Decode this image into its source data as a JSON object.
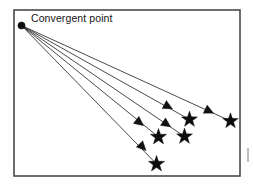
{
  "figure": {
    "label": "Convergent point",
    "label_position": {
      "x": 31,
      "y": 22
    },
    "background_color": "#ffffff",
    "frame": {
      "x": 14,
      "y": 10,
      "width": 226,
      "height": 166,
      "stroke_color": "#4a4a4a"
    },
    "convergent_point": {
      "x": 21.5,
      "y": 25.5,
      "radius": 3.6,
      "color": "#0d0d0d"
    },
    "marker_colors": {
      "ray": "#2a2a2a",
      "arrow": "#111111",
      "star": "#0d0d0d"
    },
    "ray_count": 5,
    "rays": [
      {
        "id": "ray-1",
        "name": "topmost-ray",
        "start": {
          "x": 21.5,
          "y": 25.5
        },
        "arrow": {
          "x": 209,
          "y": 111,
          "angle": 26
        },
        "star": {
          "x": 230.5,
          "y": 121,
          "size": 8.2
        },
        "end": {
          "x": 230.5,
          "y": 121
        }
      },
      {
        "id": "ray-2",
        "name": "second-ray",
        "start": {
          "x": 21.5,
          "y": 25.5
        },
        "arrow": {
          "x": 168,
          "y": 106.5,
          "angle": 28
        },
        "star": {
          "x": 189.5,
          "y": 119.5,
          "size": 8.4
        },
        "end": {
          "x": 189.5,
          "y": 119.5
        }
      },
      {
        "id": "ray-3",
        "name": "third-ray",
        "start": {
          "x": 21.5,
          "y": 25.5
        },
        "arrow": {
          "x": 166.5,
          "y": 124,
          "angle": 34
        },
        "star": {
          "x": 184.5,
          "y": 136.5,
          "size": 8.4
        },
        "end": {
          "x": 184.5,
          "y": 136.5
        }
      },
      {
        "id": "ray-4",
        "name": "fourth-ray",
        "start": {
          "x": 21.5,
          "y": 25.5
        },
        "arrow": {
          "x": 139.5,
          "y": 122.5,
          "angle": 38
        },
        "star": {
          "x": 158.5,
          "y": 137,
          "size": 8.6
        },
        "end": {
          "x": 158.5,
          "y": 137
        }
      },
      {
        "id": "ray-5",
        "name": "bottom-ray",
        "start": {
          "x": 21.5,
          "y": 25.5
        },
        "arrow": {
          "x": 142.5,
          "y": 147,
          "angle": 46
        },
        "star": {
          "x": 156.5,
          "y": 164,
          "size": 8.6
        },
        "end": {
          "x": 156.5,
          "y": 164
        }
      }
    ],
    "edge_mark": {
      "x": 247,
      "y": 148,
      "width": 2,
      "height": 14
    }
  }
}
